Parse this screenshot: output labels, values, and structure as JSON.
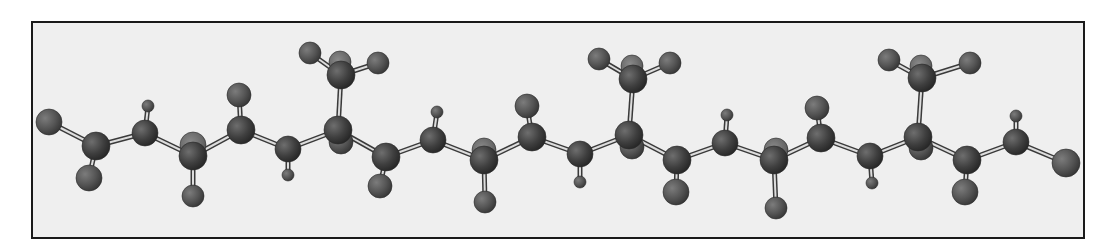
{
  "figure": {
    "type": "ball-and-stick molecular model",
    "frame": {
      "x": 32,
      "y": 22,
      "width": 1052,
      "height": 216,
      "stroke": "#1a1a1a",
      "fill": "#efefef"
    },
    "colors": {
      "atom_dark": "#3a3a3a",
      "atom_mid": "#555555",
      "atom_light": "#6a6a6a",
      "bond_outline": "#3a3a3a",
      "bond_fill": "#dddddd"
    }
  },
  "atoms": [
    {
      "id": "T1",
      "x": 49,
      "y": 122,
      "r": 13,
      "tone": "mid"
    },
    {
      "id": "C1",
      "x": 96,
      "y": 146,
      "r": 14,
      "tone": "dark"
    },
    {
      "id": "S1",
      "x": 89,
      "y": 178,
      "r": 13,
      "tone": "mid"
    },
    {
      "id": "C2",
      "x": 145,
      "y": 133,
      "r": 13,
      "tone": "dark"
    },
    {
      "id": "H2",
      "x": 148,
      "y": 106,
      "r": 6,
      "tone": "mid"
    },
    {
      "id": "C3b",
      "x": 193,
      "y": 145,
      "r": 13,
      "tone": "light"
    },
    {
      "id": "C3",
      "x": 193,
      "y": 156,
      "r": 14,
      "tone": "dark"
    },
    {
      "id": "S3",
      "x": 193,
      "y": 196,
      "r": 11,
      "tone": "mid"
    },
    {
      "id": "C4",
      "x": 241,
      "y": 130,
      "r": 14,
      "tone": "dark"
    },
    {
      "id": "S4",
      "x": 239,
      "y": 95,
      "r": 12,
      "tone": "mid"
    },
    {
      "id": "C5",
      "x": 288,
      "y": 149,
      "r": 13,
      "tone": "dark"
    },
    {
      "id": "H5",
      "x": 288,
      "y": 175,
      "r": 6,
      "tone": "mid"
    },
    {
      "id": "C6b",
      "x": 341,
      "y": 142,
      "r": 12,
      "tone": "mid"
    },
    {
      "id": "C6",
      "x": 338,
      "y": 130,
      "r": 14,
      "tone": "dark"
    },
    {
      "id": "M1",
      "x": 341,
      "y": 75,
      "r": 14,
      "tone": "dark"
    },
    {
      "id": "M1t",
      "x": 340,
      "y": 62,
      "r": 11,
      "tone": "light"
    },
    {
      "id": "M1a",
      "x": 310,
      "y": 53,
      "r": 11,
      "tone": "mid"
    },
    {
      "id": "M1c",
      "x": 378,
      "y": 63,
      "r": 11,
      "tone": "mid"
    },
    {
      "id": "C7",
      "x": 386,
      "y": 157,
      "r": 14,
      "tone": "dark"
    },
    {
      "id": "S7",
      "x": 380,
      "y": 186,
      "r": 12,
      "tone": "mid"
    },
    {
      "id": "C8",
      "x": 433,
      "y": 140,
      "r": 13,
      "tone": "dark"
    },
    {
      "id": "H8",
      "x": 437,
      "y": 112,
      "r": 6,
      "tone": "mid"
    },
    {
      "id": "C9b",
      "x": 484,
      "y": 150,
      "r": 12,
      "tone": "light"
    },
    {
      "id": "C9",
      "x": 484,
      "y": 160,
      "r": 14,
      "tone": "dark"
    },
    {
      "id": "S9",
      "x": 485,
      "y": 202,
      "r": 11,
      "tone": "mid"
    },
    {
      "id": "C10",
      "x": 532,
      "y": 137,
      "r": 14,
      "tone": "dark"
    },
    {
      "id": "S10",
      "x": 527,
      "y": 106,
      "r": 12,
      "tone": "mid"
    },
    {
      "id": "C11",
      "x": 580,
      "y": 154,
      "r": 13,
      "tone": "dark"
    },
    {
      "id": "H11",
      "x": 580,
      "y": 182,
      "r": 6,
      "tone": "mid"
    },
    {
      "id": "C12b",
      "x": 632,
      "y": 147,
      "r": 12,
      "tone": "mid"
    },
    {
      "id": "C12",
      "x": 629,
      "y": 135,
      "r": 14,
      "tone": "dark"
    },
    {
      "id": "M2",
      "x": 633,
      "y": 79,
      "r": 14,
      "tone": "dark"
    },
    {
      "id": "M2t",
      "x": 632,
      "y": 66,
      "r": 11,
      "tone": "light"
    },
    {
      "id": "M2a",
      "x": 599,
      "y": 59,
      "r": 11,
      "tone": "mid"
    },
    {
      "id": "M2c",
      "x": 670,
      "y": 63,
      "r": 11,
      "tone": "mid"
    },
    {
      "id": "C13",
      "x": 677,
      "y": 160,
      "r": 14,
      "tone": "dark"
    },
    {
      "id": "S13",
      "x": 676,
      "y": 192,
      "r": 13,
      "tone": "mid"
    },
    {
      "id": "C14",
      "x": 725,
      "y": 143,
      "r": 13,
      "tone": "dark"
    },
    {
      "id": "H14",
      "x": 727,
      "y": 115,
      "r": 6,
      "tone": "mid"
    },
    {
      "id": "C15b",
      "x": 776,
      "y": 150,
      "r": 12,
      "tone": "light"
    },
    {
      "id": "C15",
      "x": 774,
      "y": 160,
      "r": 14,
      "tone": "dark"
    },
    {
      "id": "S15",
      "x": 776,
      "y": 208,
      "r": 11,
      "tone": "mid"
    },
    {
      "id": "C16",
      "x": 821,
      "y": 138,
      "r": 14,
      "tone": "dark"
    },
    {
      "id": "S16",
      "x": 817,
      "y": 108,
      "r": 12,
      "tone": "mid"
    },
    {
      "id": "C17",
      "x": 870,
      "y": 156,
      "r": 13,
      "tone": "dark"
    },
    {
      "id": "H17",
      "x": 872,
      "y": 183,
      "r": 6,
      "tone": "mid"
    },
    {
      "id": "C18b",
      "x": 921,
      "y": 148,
      "r": 12,
      "tone": "mid"
    },
    {
      "id": "C18",
      "x": 918,
      "y": 137,
      "r": 14,
      "tone": "dark"
    },
    {
      "id": "M3",
      "x": 922,
      "y": 78,
      "r": 14,
      "tone": "dark"
    },
    {
      "id": "M3t",
      "x": 921,
      "y": 66,
      "r": 11,
      "tone": "light"
    },
    {
      "id": "M3a",
      "x": 889,
      "y": 60,
      "r": 11,
      "tone": "mid"
    },
    {
      "id": "M3c",
      "x": 970,
      "y": 63,
      "r": 11,
      "tone": "mid"
    },
    {
      "id": "C19",
      "x": 967,
      "y": 160,
      "r": 14,
      "tone": "dark"
    },
    {
      "id": "S19",
      "x": 965,
      "y": 192,
      "r": 13,
      "tone": "mid"
    },
    {
      "id": "C20",
      "x": 1016,
      "y": 142,
      "r": 13,
      "tone": "dark"
    },
    {
      "id": "H20",
      "x": 1016,
      "y": 116,
      "r": 6,
      "tone": "mid"
    },
    {
      "id": "T2",
      "x": 1066,
      "y": 163,
      "r": 14,
      "tone": "mid"
    }
  ],
  "bonds": [
    [
      "T1",
      "C1"
    ],
    [
      "C1",
      "S1"
    ],
    [
      "C1",
      "C2"
    ],
    [
      "C2",
      "H2"
    ],
    [
      "C2",
      "C3"
    ],
    [
      "C3",
      "S3"
    ],
    [
      "C3",
      "C4"
    ],
    [
      "C4",
      "S4"
    ],
    [
      "C4",
      "C5"
    ],
    [
      "C5",
      "H5"
    ],
    [
      "C5",
      "C6"
    ],
    [
      "C6",
      "M1"
    ],
    [
      "M1",
      "M1a"
    ],
    [
      "M1",
      "M1c"
    ],
    [
      "C6",
      "C7"
    ],
    [
      "C7",
      "S7"
    ],
    [
      "C7",
      "C8"
    ],
    [
      "C8",
      "H8"
    ],
    [
      "C8",
      "C9"
    ],
    [
      "C9",
      "S9"
    ],
    [
      "C9",
      "C10"
    ],
    [
      "C10",
      "S10"
    ],
    [
      "C10",
      "C11"
    ],
    [
      "C11",
      "H11"
    ],
    [
      "C11",
      "C12"
    ],
    [
      "C12",
      "M2"
    ],
    [
      "M2",
      "M2a"
    ],
    [
      "M2",
      "M2c"
    ],
    [
      "C12",
      "C13"
    ],
    [
      "C13",
      "S13"
    ],
    [
      "C13",
      "C14"
    ],
    [
      "C14",
      "H14"
    ],
    [
      "C14",
      "C15"
    ],
    [
      "C15",
      "S15"
    ],
    [
      "C15",
      "C16"
    ],
    [
      "C16",
      "S16"
    ],
    [
      "C16",
      "C17"
    ],
    [
      "C17",
      "H17"
    ],
    [
      "C17",
      "C18"
    ],
    [
      "C18",
      "M3"
    ],
    [
      "M3",
      "M3a"
    ],
    [
      "M3",
      "M3c"
    ],
    [
      "C18",
      "C19"
    ],
    [
      "C19",
      "S19"
    ],
    [
      "C19",
      "C20"
    ],
    [
      "C20",
      "H20"
    ],
    [
      "C20",
      "T2"
    ]
  ]
}
